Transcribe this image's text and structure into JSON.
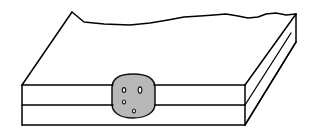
{
  "figure": {
    "title": "Geologic block diagram with stratified layer and lens inclusion",
    "caption": "",
    "background_color": "#ffffff",
    "line_color": "#000000",
    "view": "three-quarter isometric block"
  },
  "geometry": {
    "canvas": {
      "width": 311,
      "height": 137
    },
    "top_surface": {
      "name": "top-surface",
      "fill": "#ffffff",
      "description": "white upper surface of block with irregular wavy back edge",
      "front_left": [
        22,
        85
      ],
      "front_right": [
        245,
        85
      ],
      "back_right": [
        296,
        14
      ],
      "back_left": [
        72,
        12
      ],
      "wavy_back_edge_points": "72,12 84,22 104,24 130,25 150,23 168,20 184,17 200,16 214,15 226,14 238,16 248,18 258,17 266,14 276,13 286,15 296,14"
    },
    "front_face": {
      "name": "front-face",
      "fill": "#ffffff",
      "top_y": 85,
      "mid_y": 105,
      "bottom_y": 125,
      "left_x": 22,
      "right_x": 245
    },
    "right_face": {
      "name": "right-side-face",
      "fill": "#ffffff",
      "corner_front_top": [
        245,
        85
      ],
      "corner_front_bottom": [
        245,
        125
      ],
      "corner_back_top": [
        296,
        14
      ],
      "corner_back_bottom": [
        296,
        42
      ],
      "bevel_lines": 2
    },
    "bed_lines": [
      {
        "name": "upper-bed-boundary",
        "y": 85
      },
      {
        "name": "middle-bed-boundary",
        "y": 105
      },
      {
        "name": "lower-bed-boundary",
        "y": 125
      }
    ],
    "lens": {
      "name": "lens-inclusion",
      "fill_color": "#b8b8b8",
      "stroke_color": "#111111",
      "center": [
        133,
        97
      ],
      "width": 46,
      "height": 46,
      "path": "M 112,88 C 112,78 120,74 133,74 C 146,74 155,78 155,88 L 155,104 C 155,112 147,118 133,118 C 119,118 112,112 112,104 Z",
      "speckles": [
        {
          "name": "speckle-upper-left",
          "cx": 124,
          "cy": 90,
          "rx": 1.7,
          "ry": 2.4,
          "rotate": 0
        },
        {
          "name": "speckle-upper-right",
          "cx": 140,
          "cy": 90,
          "rx": 1.8,
          "ry": 3.1,
          "rotate": 0
        },
        {
          "name": "speckle-lower-left",
          "cx": 124,
          "cy": 102,
          "rx": 1.5,
          "ry": 2.0,
          "rotate": 0
        },
        {
          "name": "speckle-bottom",
          "cx": 134,
          "cy": 111,
          "rx": 1.5,
          "ry": 2.0,
          "rotate": 0
        }
      ]
    }
  },
  "labels": {
    "none": ""
  }
}
